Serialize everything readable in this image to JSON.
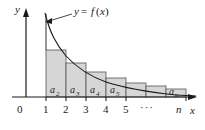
{
  "figure": {
    "kind": "integral-test-diagram",
    "width": 205,
    "height": 130,
    "background_color": "#ffffff",
    "stroke_color": "#1a1a1a",
    "bar_fill_color": "#d6d6d6",
    "bar_edge_color": "#555555"
  },
  "axes": {
    "y_axis_label": "y",
    "x_axis_label": "x",
    "origin_label": "0",
    "x_tick_labels": [
      "1",
      "2",
      "3",
      "4",
      "5"
    ],
    "x_ellipsis": "···",
    "x_last_tick_label": "n",
    "x_axis_origin_px": 26,
    "x_baseline_px": 97,
    "x_tick_spacing_px": 20,
    "x_first_tick_px": 46
  },
  "curve": {
    "label": "y = f(x)",
    "label_parts": {
      "y": "y",
      "equals": "=",
      "f": "f",
      "open": "(",
      "x": "x",
      "close": ")"
    },
    "description": "decreasing positive function"
  },
  "bars": [
    {
      "label": "a",
      "subscript": "2",
      "x_left": 46,
      "x_right": 66,
      "top": 50
    },
    {
      "label": "a",
      "subscript": "3",
      "x_left": 66,
      "x_right": 86,
      "top": 63
    },
    {
      "label": "a",
      "subscript": "4",
      "x_left": 86,
      "x_right": 106,
      "top": 72
    },
    {
      "label": "a",
      "subscript": "5",
      "x_left": 106,
      "x_right": 126,
      "top": 78
    },
    {
      "label": "",
      "subscript": "",
      "x_left": 126,
      "x_right": 146,
      "top": 83
    },
    {
      "label": "",
      "subscript": "",
      "x_left": 146,
      "x_right": 166,
      "top": 86
    },
    {
      "label": "a",
      "subscript": "n",
      "x_left": 166,
      "x_right": 186,
      "top": 89
    }
  ]
}
